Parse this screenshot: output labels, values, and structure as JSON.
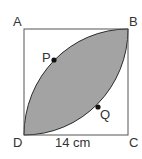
{
  "figure": {
    "type": "square-with-lens",
    "vertices": {
      "A": "A",
      "B": "B",
      "C": "C",
      "D": "D"
    },
    "points": {
      "P": "P",
      "Q": "Q"
    },
    "side_label": "14 cm",
    "colors": {
      "fill": "#a3a3a3",
      "stroke": "#2b2b2b",
      "square": "#555555"
    }
  }
}
